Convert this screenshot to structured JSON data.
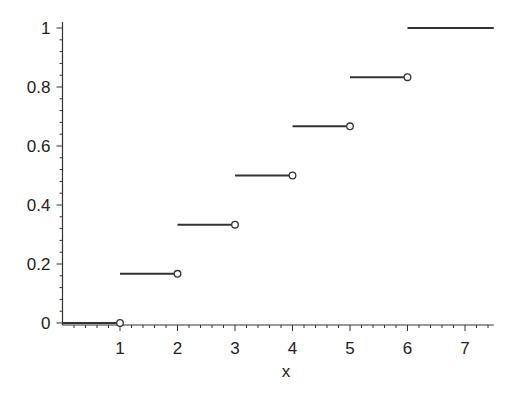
{
  "chart_data": {
    "type": "line",
    "subtype": "step",
    "title": "",
    "xlabel": "x",
    "ylabel": "",
    "xlim": [
      0,
      7.5
    ],
    "ylim": [
      0,
      1
    ],
    "x_ticks": [
      1,
      2,
      3,
      4,
      5,
      6,
      7
    ],
    "y_ticks": [
      0,
      0.2,
      0.4,
      0.6,
      0.8,
      1
    ],
    "x_tick_labels": [
      "1",
      "2",
      "3",
      "4",
      "5",
      "6",
      "7"
    ],
    "y_tick_labels": [
      "0",
      "0.2",
      "0.4",
      "0.6",
      "0.8",
      "1"
    ],
    "grid": false,
    "legend": null,
    "segments": [
      {
        "x_start": 0,
        "x_end": 1,
        "y": 0,
        "open_right": true
      },
      {
        "x_start": 1,
        "x_end": 2,
        "y": 0.1667,
        "open_right": true
      },
      {
        "x_start": 2,
        "x_end": 3,
        "y": 0.3333,
        "open_right": true
      },
      {
        "x_start": 3,
        "x_end": 4,
        "y": 0.5,
        "open_right": true
      },
      {
        "x_start": 4,
        "x_end": 5,
        "y": 0.6667,
        "open_right": true
      },
      {
        "x_start": 5,
        "x_end": 6,
        "y": 0.8333,
        "open_right": true
      },
      {
        "x_start": 6,
        "x_end": 7.5,
        "y": 1,
        "open_right": false
      }
    ],
    "line_color": "#333333"
  }
}
